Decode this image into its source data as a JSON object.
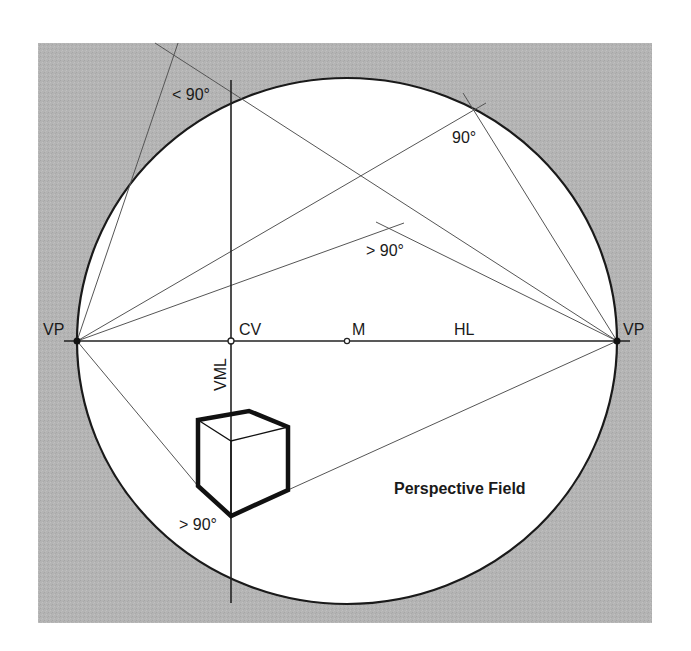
{
  "diagram": {
    "title": "Perspective Field",
    "colors": {
      "background": "#ffffff",
      "outer_field": "#b4b4b4",
      "circle_fill": "#ffffff",
      "line": "#222222",
      "thin_line": "#555555"
    },
    "labels": {
      "vp_left": "VP",
      "vp_right": "VP",
      "cv": "CV",
      "m": "M",
      "hl": "HL",
      "vml": "VML",
      "angle_top_left": "< 90°",
      "angle_top_right": "90°",
      "angle_middle": "> 90°",
      "angle_bottom": "> 90°",
      "field_label": "Perspective Field"
    },
    "points": {
      "vp_left": [
        77,
        341
      ],
      "vp_right": [
        617,
        341
      ],
      "cv": [
        231,
        341
      ],
      "m": [
        347,
        341
      ]
    }
  }
}
